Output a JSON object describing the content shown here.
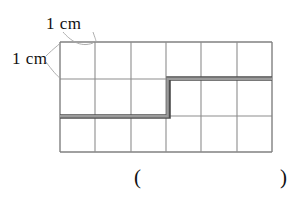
{
  "figure": {
    "type": "geometry-worksheet-figure",
    "labels": {
      "unit_width": "1 cm",
      "unit_height": "1 cm"
    },
    "answer_blank": {
      "open_paren": "(",
      "close_paren": ")",
      "value": ""
    },
    "top_noise": "",
    "colors": {
      "grid_line": "#777777",
      "grid_line_light": "#8d8d8d",
      "path_line": "#8a8a8a",
      "path_edge": "#4a4a4a",
      "leader_line": "#9a9a9a",
      "text": "#111111",
      "background": "#ffffff"
    }
  },
  "grid": {
    "columns": 6,
    "rows": 3,
    "cell_width_px": 35.33,
    "cell_height_px": 36.67,
    "left_px": 60,
    "top_px": 42,
    "right_px": 272,
    "bottom_px": 152,
    "column_x": [
      60,
      95,
      131,
      166,
      201,
      237,
      272
    ],
    "row_y": [
      42,
      79,
      116,
      152
    ],
    "unit_label": "1 cm"
  },
  "highlighted_path": {
    "description": "staircase boundary rising from lower-left to upper-right",
    "segments": [
      {
        "name": "lower-horizontal",
        "x1": 60,
        "y1": 116,
        "x2": 168,
        "y2": 116
      },
      {
        "name": "vertical-riser",
        "x1": 167,
        "y1": 117,
        "x2": 167,
        "y2": 78
      },
      {
        "name": "upper-horizontal",
        "x1": 166,
        "y1": 79,
        "x2": 272,
        "y2": 79
      }
    ],
    "stroke_width_px": 4
  },
  "leaders": [
    {
      "name": "top-unit-leader",
      "from_x": 62,
      "from_y": 31,
      "to_x": 95,
      "to_y": 42
    },
    {
      "name": "left-unit-leader",
      "from_x": 47,
      "from_y": 58,
      "to_x": 60,
      "to_y": 79
    }
  ]
}
